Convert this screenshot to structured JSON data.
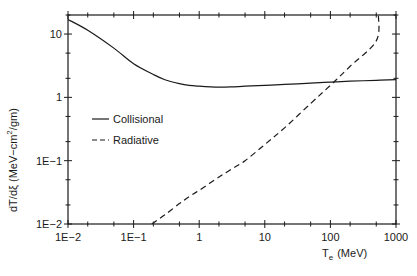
{
  "chart_data": {
    "type": "line",
    "title": "",
    "xlabel": "T_e (MeV)",
    "xlabel_main": "T",
    "xlabel_sub": "e",
    "xlabel_units": "(MeV)",
    "ylabel": "dT/dξ (MeV-cm²/gm)",
    "ylabel_main": "dT/dξ (MeV−cm",
    "ylabel_sup": "2",
    "ylabel_tail": "/gm)",
    "xscale": "log",
    "yscale": "log",
    "xlim": [
      0.01,
      1000
    ],
    "ylim": [
      0.01,
      20
    ],
    "grid": false,
    "legend_position": "center-left",
    "x_ticks": [
      {
        "value": 0.01,
        "label": "1E−2"
      },
      {
        "value": 0.1,
        "label": "1E−1"
      },
      {
        "value": 1,
        "label": "1"
      },
      {
        "value": 10,
        "label": "10"
      },
      {
        "value": 100,
        "label": "100"
      },
      {
        "value": 1000,
        "label": "1000"
      }
    ],
    "y_ticks": [
      {
        "value": 0.01,
        "label": "1E−2"
      },
      {
        "value": 0.1,
        "label": "1E−1"
      },
      {
        "value": 1,
        "label": "1"
      },
      {
        "value": 10,
        "label": "10"
      }
    ],
    "series": [
      {
        "name": "Collisional",
        "style": "solid",
        "x": [
          0.01,
          0.02,
          0.05,
          0.1,
          0.2,
          0.3,
          0.5,
          0.7,
          1,
          1.5,
          2,
          3,
          5,
          10,
          20,
          50,
          100,
          200,
          500,
          1000
        ],
        "y": [
          17,
          11.5,
          6.0,
          3.4,
          2.3,
          1.9,
          1.65,
          1.55,
          1.5,
          1.46,
          1.45,
          1.46,
          1.5,
          1.55,
          1.6,
          1.68,
          1.74,
          1.8,
          1.86,
          1.9
        ]
      },
      {
        "name": "Radiative",
        "style": "dashed",
        "x": [
          0.19,
          0.3,
          0.5,
          0.7,
          1,
          2,
          3,
          5,
          10,
          20,
          50,
          100,
          200,
          500,
          540
        ],
        "y": [
          0.01,
          0.014,
          0.021,
          0.027,
          0.034,
          0.055,
          0.072,
          0.1,
          0.18,
          0.33,
          0.8,
          1.55,
          3.1,
          7.8,
          20
        ]
      }
    ]
  }
}
